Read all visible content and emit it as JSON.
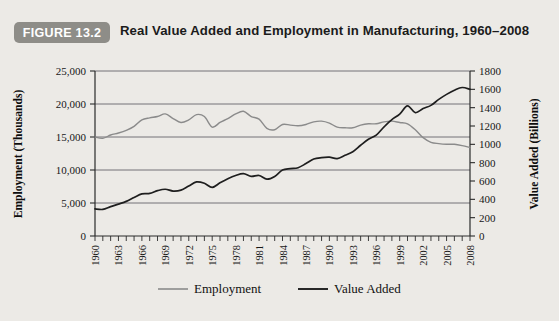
{
  "figure": {
    "badge": "FIGURE 13.2",
    "title": "Real Value Added and Employment in Manufacturing, 1960–2008",
    "badge_color": "#8e8d88",
    "background_color": "#eceae6"
  },
  "legend": {
    "position": "bottom",
    "items": [
      {
        "label": "Employment",
        "color": "#8b8b8b"
      },
      {
        "label": "Value Added",
        "color": "#1e1e1e"
      }
    ]
  },
  "chart_data": {
    "type": "line",
    "title": "Real Value Added and Employment in Manufacturing, 1960–2008",
    "xlabel": "",
    "ylabel": "Employment (Thousands)",
    "y2label": "Value Added (Billions)",
    "grid": true,
    "xlim": [
      1960,
      2008
    ],
    "ylim": [
      0,
      25000
    ],
    "y2lim": [
      0,
      1800
    ],
    "yticks": [
      "0",
      "5,000",
      "10,000",
      "15,000",
      "20,000",
      "25,000"
    ],
    "ytick_values": [
      0,
      5000,
      10000,
      15000,
      20000,
      25000
    ],
    "y2ticks": [
      "0",
      "200",
      "400",
      "600",
      "800",
      "1000",
      "1200",
      "1400",
      "1600",
      "1800"
    ],
    "y2tick_values": [
      0,
      200,
      400,
      600,
      800,
      1000,
      1200,
      1400,
      1600,
      1800
    ],
    "xticks": [
      "1960",
      "1963",
      "1966",
      "1969",
      "1972",
      "1975",
      "1978",
      "1981",
      "1984",
      "1987",
      "1990",
      "1993",
      "1996",
      "1999",
      "2002",
      "2005",
      "2008"
    ],
    "x": [
      1960,
      1961,
      1962,
      1963,
      1964,
      1965,
      1966,
      1967,
      1968,
      1969,
      1970,
      1971,
      1972,
      1973,
      1974,
      1975,
      1976,
      1977,
      1978,
      1979,
      1980,
      1981,
      1982,
      1983,
      1984,
      1985,
      1986,
      1987,
      1988,
      1989,
      1990,
      1991,
      1992,
      1993,
      1994,
      1995,
      1996,
      1997,
      1998,
      1999,
      2000,
      2001,
      2002,
      2003,
      2004,
      2005,
      2006,
      2007,
      2008
    ],
    "series": [
      {
        "name": "Employment",
        "axis": "left",
        "unit": "Thousands",
        "color": "#8b8b8b",
        "values": [
          15000,
          14800,
          15300,
          15600,
          16000,
          16600,
          17600,
          17900,
          18100,
          18500,
          17800,
          17200,
          17600,
          18400,
          18100,
          16500,
          17200,
          17800,
          18500,
          18900,
          18100,
          17700,
          16300,
          16100,
          16900,
          16800,
          16700,
          16900,
          17300,
          17400,
          17100,
          16500,
          16400,
          16400,
          16800,
          17000,
          17000,
          17300,
          17400,
          17200,
          17000,
          16100,
          14900,
          14200,
          14000,
          13900,
          13900,
          13700,
          13400
        ]
      },
      {
        "name": "Value Added",
        "axis": "right",
        "unit": "Billions",
        "color": "#1e1e1e",
        "values": [
          296,
          290,
          320,
          348,
          378,
          420,
          460,
          465,
          495,
          510,
          490,
          500,
          545,
          590,
          575,
          530,
          580,
          625,
          660,
          680,
          650,
          660,
          620,
          650,
          720,
          735,
          745,
          790,
          840,
          855,
          860,
          845,
          880,
          920,
          990,
          1055,
          1100,
          1190,
          1270,
          1330,
          1420,
          1345,
          1390,
          1425,
          1490,
          1545,
          1590,
          1620,
          1600
        ]
      }
    ]
  }
}
